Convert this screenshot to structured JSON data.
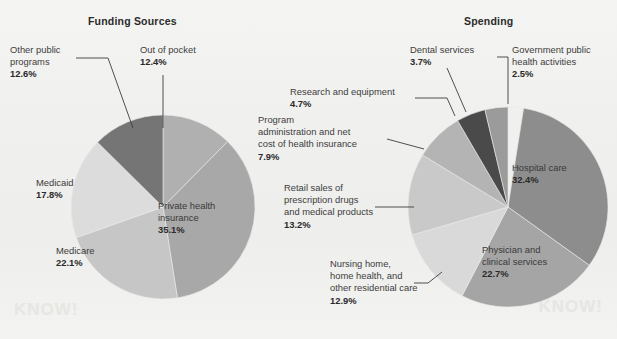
{
  "figure": {
    "background_color": "#f1f1ef",
    "watermark_left": "KNOW!",
    "watermark_right": "KNOW!"
  },
  "charts": [
    {
      "id": "funding-sources",
      "title": "Funding Sources",
      "type": "pie",
      "categories": [
        "Out of pocket",
        "Private health insurance",
        "Medicare",
        "Medicaid",
        "Other public programs"
      ],
      "values": [
        12.4,
        35.1,
        22.1,
        17.8,
        12.6
      ],
      "value_labels": [
        "12.4%",
        "35.1%",
        "22.1%",
        "17.8%",
        "12.6%"
      ],
      "colors": [
        "#b0b0b0",
        "#a8a8a8",
        "#c6c6c6",
        "#dcdcdc",
        "#757575"
      ],
      "start_angle_deg": 0,
      "direction": "clockwise",
      "labels": [
        {
          "name": "Out of pocket",
          "pct": "12.4%",
          "placement": "outside-leader"
        },
        {
          "name": "Private health insurance",
          "pct": "35.1%",
          "placement": "inside"
        },
        {
          "name": "Medicare",
          "pct": "22.1%",
          "placement": "inside"
        },
        {
          "name": "Medicaid",
          "pct": "17.8%",
          "placement": "inside"
        },
        {
          "name": "Other public programs",
          "pct": "12.6%",
          "placement": "outside-leader"
        }
      ]
    },
    {
      "id": "spending",
      "title": "Spending",
      "type": "pie",
      "categories": [
        "Government public health activities",
        "Hospital care",
        "Physician and clinical services",
        "Nursing home, home health, and other residential care",
        "Retail sales of prescription drugs and medical products",
        "Program administration and net cost of health insurance",
        "Research and equipment",
        "Dental services"
      ],
      "values": [
        2.5,
        32.4,
        22.7,
        12.9,
        13.2,
        7.9,
        4.7,
        3.7
      ],
      "value_labels": [
        "2.5%",
        "32.4%",
        "22.7%",
        "12.9%",
        "13.2%",
        "7.9%",
        "4.7%",
        "3.7%"
      ],
      "colors": [
        "#f0f0ee",
        "#8d8d8d",
        "#a5a5a5",
        "#d9d9d9",
        "#c9c9c9",
        "#b4b4b4",
        "#4a4a4a",
        "#9b9b9b"
      ],
      "start_angle_deg": 0,
      "direction": "clockwise",
      "labels": [
        {
          "name": "Government public health activities",
          "pct": "2.5%",
          "placement": "outside-leader"
        },
        {
          "name": "Hospital care",
          "pct": "32.4%",
          "placement": "inside"
        },
        {
          "name": "Physician and clinical services",
          "pct": "22.7%",
          "placement": "inside"
        },
        {
          "name": "Nursing home, home health, and other residential care",
          "pct": "12.9%",
          "placement": "outside-leader"
        },
        {
          "name": "Retail sales of prescription drugs and medical products",
          "pct": "13.2%",
          "placement": "outside-leader"
        },
        {
          "name": "Program administration and net cost of health insurance",
          "pct": "7.9%",
          "placement": "outside-leader"
        },
        {
          "name": "Research and equipment",
          "pct": "4.7%",
          "placement": "outside-leader"
        },
        {
          "name": "Dental services",
          "pct": "3.7%",
          "placement": "outside-leader"
        }
      ]
    }
  ],
  "text": {
    "funding": {
      "out_of_pocket_name": "Out of pocket",
      "out_of_pocket_pct": "12.4%",
      "other_public_l1": "Other public",
      "other_public_l2": "programs",
      "other_public_pct": "12.6%",
      "medicaid_name": "Medicaid",
      "medicaid_pct": "17.8%",
      "medicare_name": "Medicare",
      "medicare_pct": "22.1%",
      "private_l1": "Private health",
      "private_l2": "insurance",
      "private_pct": "35.1%"
    },
    "spending": {
      "dental_name": "Dental services",
      "dental_pct": "3.7%",
      "gov_l1": "Government public",
      "gov_l2": "health activities",
      "gov_pct": "2.5%",
      "research_name": "Research and equipment",
      "research_pct": "4.7%",
      "program_l1": "Program",
      "program_l2": "administration and net",
      "program_l3": "cost of health insurance",
      "program_pct": "7.9%",
      "retail_l1": "Retail sales of",
      "retail_l2": "prescription drugs",
      "retail_l3": "and medical products",
      "retail_pct": "13.2%",
      "nursing_l1": "Nursing home,",
      "nursing_l2": "home health, and",
      "nursing_l3": "other residential care",
      "nursing_pct": "12.9%",
      "hospital_l1": "Hospital care",
      "hospital_pct": "32.4%",
      "physician_l1": "Physician and",
      "physician_l2": "clinical services",
      "physician_pct": "22.7%"
    }
  }
}
